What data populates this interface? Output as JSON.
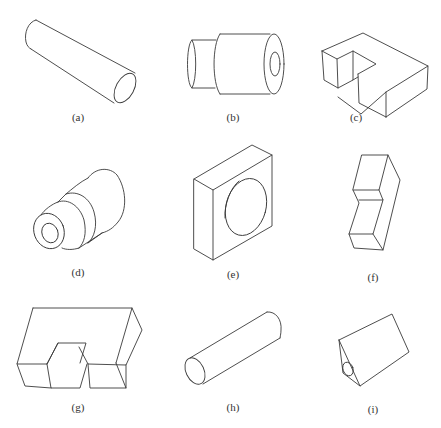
{
  "figure": {
    "panels": [
      {
        "id": "a",
        "label": "(a)",
        "shape": "long cylinder, axis descending to the right"
      },
      {
        "id": "b",
        "label": "(b)",
        "shape": "stepped cylinder with through hole"
      },
      {
        "id": "c",
        "label": "(c)",
        "shape": "rectangular block with corner notch"
      },
      {
        "id": "d",
        "label": "(d)",
        "shape": "stepped conical part with bore"
      },
      {
        "id": "e",
        "label": "(e)",
        "shape": "square block with circular hole"
      },
      {
        "id": "f",
        "label": "(f)",
        "shape": "zig-zag block"
      },
      {
        "id": "g",
        "label": "(g)",
        "shape": "U-shaped block with slot"
      },
      {
        "id": "h",
        "label": "(h)",
        "shape": "cylinder, axis ascending to the right"
      },
      {
        "id": "i",
        "label": "(i)",
        "shape": "triangular prism with hole in end face"
      }
    ],
    "stroke_color": "#3a3a3a",
    "background": "#ffffff"
  }
}
